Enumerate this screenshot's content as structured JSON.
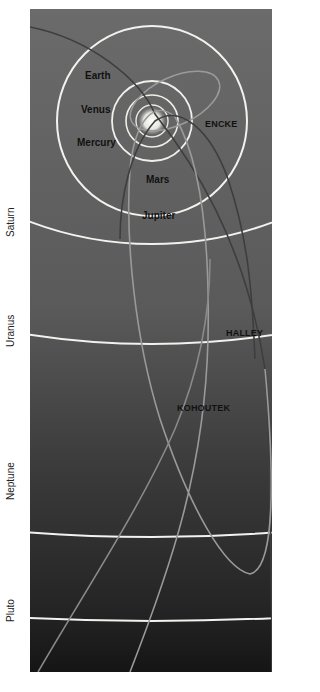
{
  "diagram": {
    "colors": {
      "background_top": "#6a6a6a",
      "background_bottom": "#1a1a1a",
      "planet_orbit": "#f2f2ee",
      "comet_orbit": "#8a8a8a",
      "comet_orbit_dark": "#3a3a3a",
      "sun": "#e8e8e0",
      "page": "#ffffff"
    },
    "inner_planets": [
      {
        "name": "Mercury",
        "label": "Mercury"
      },
      {
        "name": "Venus",
        "label": "Venus"
      },
      {
        "name": "Earth",
        "label": "Earth"
      },
      {
        "name": "Mars",
        "label": "Mars"
      },
      {
        "name": "Jupiter",
        "label": "Jupiter"
      }
    ],
    "outer_planets": [
      {
        "name": "Saturn",
        "label": "Saturn"
      },
      {
        "name": "Uranus",
        "label": "Uranus"
      },
      {
        "name": "Neptune",
        "label": "Neptune"
      },
      {
        "name": "Pluto",
        "label": "Pluto"
      }
    ],
    "comets": [
      {
        "name": "Encke",
        "label": "ENCKE"
      },
      {
        "name": "Halley",
        "label": "HALLEY"
      },
      {
        "name": "Kohoutek",
        "label": "KOHOUTEK"
      }
    ]
  }
}
